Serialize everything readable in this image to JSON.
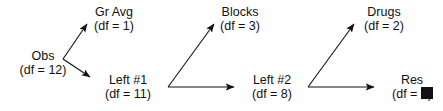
{
  "figure": {
    "type": "vector-decomposition-diagram",
    "panels": [
      {
        "id": "panel-1",
        "origin_label": {
          "name": "Obs",
          "df": "(df = 12)"
        },
        "branches": [
          {
            "id": "branch-gr-avg",
            "name": "Gr Avg",
            "df": "(df = 1)",
            "direction": "up-right"
          },
          {
            "id": "branch-left-1",
            "name": "Left #1",
            "df": "(df = 11)",
            "direction": "down-right"
          }
        ]
      },
      {
        "id": "panel-2",
        "origin_label": null,
        "branches": [
          {
            "id": "branch-blocks",
            "name": "Blocks",
            "df": "(df = 3)",
            "direction": "up-right"
          },
          {
            "id": "branch-left-2",
            "name": "Left #2",
            "df": "(df = 8)",
            "direction": "right"
          }
        ]
      },
      {
        "id": "panel-3",
        "origin_label": null,
        "branches": [
          {
            "id": "branch-drugs",
            "name": "Drugs",
            "df": "(df = 2)",
            "direction": "up-right"
          },
          {
            "id": "branch-res",
            "name": "Res",
            "df": "(df = 6)",
            "direction": "right"
          }
        ]
      }
    ],
    "end_marker": {
      "shape": "filled-square",
      "color": "#111111"
    },
    "colors": {
      "ink": "#111111",
      "background": "#ffffff",
      "arrow": "#333333"
    }
  }
}
